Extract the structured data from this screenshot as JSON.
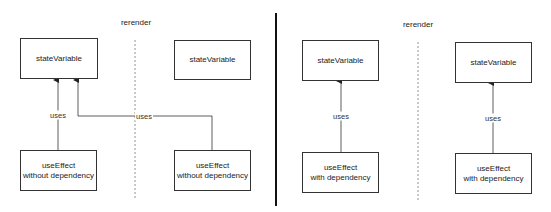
{
  "left_panel": {
    "rerender_label": "rerender",
    "before": {
      "state_box": "stateVariable",
      "effect_box_line1": "useEffect",
      "effect_box_line2": "without dependency",
      "edge_label": "uses"
    },
    "after": {
      "state_box": "stateVariable",
      "effect_box_line1": "useEffect",
      "effect_box_line2": "without dependency",
      "edge_label": "uses"
    }
  },
  "right_panel": {
    "rerender_label": "rerender",
    "before": {
      "state_box": "stateVariable",
      "effect_box_line1": "useEffect",
      "effect_box_line2": "with dependency",
      "edge_label": "uses"
    },
    "after": {
      "state_box": "stateVariable",
      "effect_box_line1": "useEffect",
      "effect_box_line2": "with dependency",
      "edge_label": "uses"
    }
  },
  "colors": {
    "line": "#333333",
    "divider": "#111111",
    "dashed": "#777777"
  }
}
